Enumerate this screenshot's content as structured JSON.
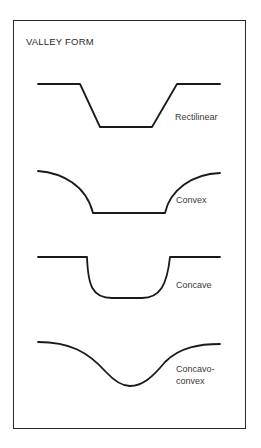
{
  "title": "VALLEY FORM",
  "profiles": [
    {
      "name": "rectilinear",
      "label": "Rectilinear"
    },
    {
      "name": "convex",
      "label": "Convex"
    },
    {
      "name": "concave",
      "label": "Concave"
    },
    {
      "name": "concavo-convex",
      "label_line1": "Concavo-",
      "label_line2": "convex"
    }
  ],
  "colors": {
    "stroke": "#1a1a1a",
    "text": "#3a3a3a",
    "background": "#ffffff"
  }
}
